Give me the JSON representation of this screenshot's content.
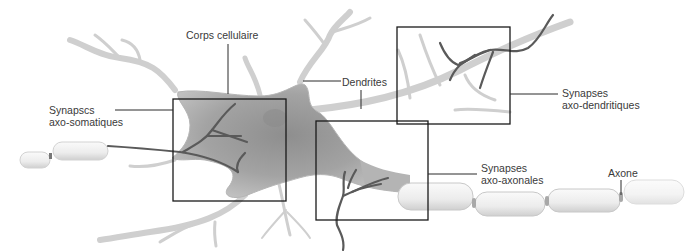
{
  "figure": {
    "colors": {
      "cell_fill": "#9a9a9a",
      "dendrite_fill": "#d4d4d4",
      "myelin_fill": "#ededed",
      "terminal_stroke": "#5a5a5a",
      "box_stroke": "#1a1a1a",
      "leader_stroke": "#2a2a2a",
      "label_text": "#3a3a3a"
    },
    "labels": {
      "corps_cellulaire": "Corps cellulaire",
      "dendrites": "Dendrites",
      "axo_somatiques": {
        "line1": "Synapscs",
        "line2": "axo-somatiques"
      },
      "axo_dendritiques": {
        "line1": "Synapses",
        "line2": "axo-dendritiques"
      },
      "axo_axonales": {
        "line1": "Synapses",
        "line2": "axo-axonales"
      },
      "axone": "Axone"
    }
  }
}
